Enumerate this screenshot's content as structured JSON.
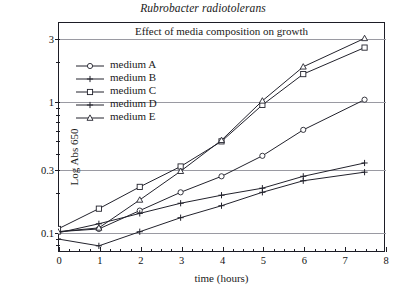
{
  "figure": {
    "species_title": "Rubrobacter radiotolerans",
    "plot_title": "Effect of media composition on growth",
    "xlabel": "time (hours)",
    "ylabel": "Log Abs 650"
  },
  "legend": {
    "items": [
      {
        "label": "medium A",
        "marker": "circle"
      },
      {
        "label": "medium B",
        "marker": "plus"
      },
      {
        "label": "medium C",
        "marker": "square"
      },
      {
        "label": "medium D",
        "marker": "plus"
      },
      {
        "label": "medium E",
        "marker": "triangle"
      }
    ]
  },
  "axes": {
    "x_ticks": [
      "0",
      "1",
      "2",
      "3",
      "4",
      "5",
      "6",
      "7",
      "8"
    ],
    "y_ticks": [
      "0.1",
      "0.3",
      "1",
      "3"
    ]
  },
  "chart_data": {
    "type": "line",
    "title": "Effect of media composition on growth",
    "subtitle": "Rubrobacter radiotolerans",
    "xlabel": "time (hours)",
    "ylabel": "Log Abs 650",
    "yscale": "log",
    "xlim": [
      0,
      8
    ],
    "ylim": [
      0.07,
      4.0
    ],
    "grid": true,
    "gridlines_y": [
      0.1,
      0.3,
      1,
      3
    ],
    "legend_position": "upper-left-inside",
    "x": [
      0,
      1,
      2,
      3,
      4,
      5,
      6,
      7.5
    ],
    "series": [
      {
        "name": "medium A",
        "marker": "circle",
        "values": [
          0.1,
          0.105,
          0.145,
          0.2,
          0.265,
          0.38,
          0.6,
          1.02
        ]
      },
      {
        "name": "medium B",
        "marker": "plus",
        "values": [
          0.088,
          0.078,
          0.1,
          0.128,
          0.158,
          0.2,
          0.245,
          0.285
        ]
      },
      {
        "name": "medium C",
        "marker": "square",
        "values": [
          0.105,
          0.15,
          0.22,
          0.315,
          0.49,
          0.93,
          1.6,
          2.55
        ]
      },
      {
        "name": "medium D",
        "marker": "plus",
        "values": [
          0.098,
          0.115,
          0.138,
          0.165,
          0.19,
          0.215,
          0.265,
          0.335
        ]
      },
      {
        "name": "medium E",
        "marker": "triangle",
        "values": [
          0.1,
          0.107,
          0.175,
          0.29,
          0.5,
          1.0,
          1.82,
          3.0
        ]
      }
    ]
  }
}
